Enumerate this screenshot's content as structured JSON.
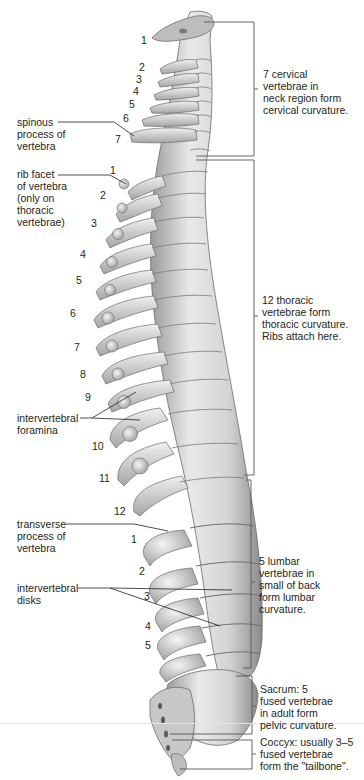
{
  "diagram": {
    "type": "anatomical-illustration",
    "colors": {
      "bone": "#cfcfcf",
      "bone_shadow": "#8e8e8e",
      "bone_highlight": "#f2f2f2",
      "line": "#231f20",
      "bracket": "#555555"
    }
  },
  "left_labels": [
    {
      "id": "spinous",
      "text": "spinous\nprocess of\nvertebra"
    },
    {
      "id": "rib-facet",
      "text": "rib facet\nof vertebra\n(only on\nthoracic\nvertebrae)"
    },
    {
      "id": "foramina",
      "text": "intervertebral\nforamina"
    },
    {
      "id": "transverse",
      "text": "transverse\nprocess of\nvertebra"
    },
    {
      "id": "disks",
      "text": "intervertebral\ndisks"
    }
  ],
  "regions": [
    {
      "id": "cervical",
      "text": "7 cervical\nvertebrae in\nneck region form\ncervical curvature."
    },
    {
      "id": "thoracic",
      "text": "12 thoracic\nvertebrae form\nthoracic curvature.\nRibs attach here."
    },
    {
      "id": "lumbar",
      "text": "5 lumbar\nvertebrae in\nsmall of back\nform lumbar\ncurvature."
    },
    {
      "id": "sacrum",
      "text": "Sacrum: 5\nfused vertebrae\nin adult form\npelvic curvature."
    },
    {
      "id": "coccyx",
      "text": "Coccyx: usually 3–5\nfused vertebrae\nform the \"tailbone\"."
    }
  ],
  "numbers": {
    "cervical": [
      "1",
      "2",
      "3",
      "4",
      "5",
      "6",
      "7"
    ],
    "thoracic": [
      "1",
      "2",
      "3",
      "4",
      "5",
      "6",
      "7",
      "8",
      "9",
      "10",
      "11",
      "12"
    ],
    "lumbar": [
      "1",
      "2",
      "3",
      "4",
      "5"
    ]
  }
}
